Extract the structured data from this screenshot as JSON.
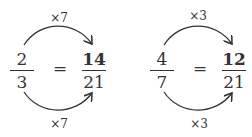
{
  "examples": [
    {
      "left": {
        "numerator": "2",
        "denominator": "3"
      },
      "equals": "=",
      "right": {
        "numerator": "14",
        "denominator": "21"
      },
      "top_multiplier": "×7",
      "bottom_multiplier": "×7"
    },
    {
      "left": {
        "numerator": "4",
        "denominator": "7"
      },
      "equals": "=",
      "right": {
        "numerator": "12",
        "denominator": "21"
      },
      "top_multiplier": "×3",
      "bottom_multiplier": "×3"
    }
  ]
}
